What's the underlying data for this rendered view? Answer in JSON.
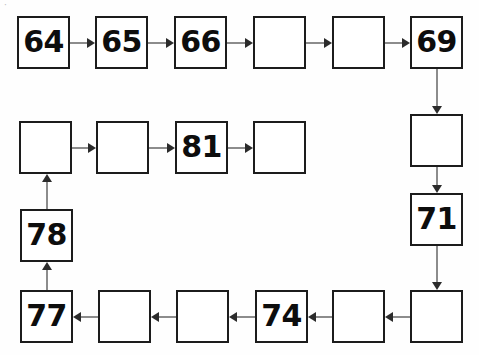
{
  "worksheet": {
    "kind": "number-sequence-chain",
    "description": "Snake-path chain of 21 square boxes; some contain numbers, the rest are blank for the student to fill in.",
    "artifact_mark": "·",
    "sequence_start": 64,
    "sequence_end": 84,
    "step": 1,
    "box_size": 53,
    "colors": {
      "page_background": "#fefefe",
      "box_border": "#1c1c1c",
      "box_fill": "#ffffff",
      "number_text": "#0d0d0d",
      "connector_line": "#8c8c8c",
      "arrow_head": "#2b2b2b"
    },
    "rows": [
      {
        "name": "top-row",
        "direction": "left-to-right",
        "cells": [
          {
            "id": "cell-64",
            "value": "64",
            "filled": true,
            "x": 17,
            "y": 16
          },
          {
            "id": "cell-65",
            "value": "65",
            "filled": true,
            "x": 95,
            "y": 16
          },
          {
            "id": "cell-66",
            "value": "66",
            "filled": true,
            "x": 174,
            "y": 16
          },
          {
            "id": "cell-67",
            "value": "",
            "filled": false,
            "x": 253,
            "y": 16
          },
          {
            "id": "cell-68",
            "value": "",
            "filled": false,
            "x": 332,
            "y": 16
          },
          {
            "id": "cell-69",
            "value": "69",
            "filled": true,
            "x": 410,
            "y": 16
          }
        ]
      },
      {
        "name": "right-column",
        "direction": "top-to-bottom",
        "cells": [
          {
            "id": "cell-70",
            "value": "",
            "filled": false,
            "x": 410,
            "y": 114
          },
          {
            "id": "cell-71",
            "value": "71",
            "filled": true,
            "x": 410,
            "y": 193
          },
          {
            "id": "cell-72",
            "value": "",
            "filled": false,
            "x": 410,
            "y": 290
          }
        ]
      },
      {
        "name": "bottom-row",
        "direction": "right-to-left",
        "cells": [
          {
            "id": "cell-73",
            "value": "",
            "filled": false,
            "x": 332,
            "y": 290
          },
          {
            "id": "cell-74",
            "value": "74",
            "filled": true,
            "x": 255,
            "y": 290
          },
          {
            "id": "cell-75",
            "value": "",
            "filled": false,
            "x": 176,
            "y": 290
          },
          {
            "id": "cell-76",
            "value": "",
            "filled": false,
            "x": 98,
            "y": 290
          },
          {
            "id": "cell-77",
            "value": "77",
            "filled": true,
            "x": 20,
            "y": 290
          }
        ]
      },
      {
        "name": "left-column",
        "direction": "bottom-to-top",
        "cells": [
          {
            "id": "cell-78",
            "value": "78",
            "filled": true,
            "x": 20,
            "y": 209
          },
          {
            "id": "cell-79",
            "value": "",
            "filled": false,
            "x": 19,
            "y": 121
          }
        ]
      },
      {
        "name": "middle-row",
        "direction": "left-to-right",
        "cells": [
          {
            "id": "cell-80",
            "value": "",
            "filled": false,
            "x": 96,
            "y": 121
          },
          {
            "id": "cell-81",
            "value": "81",
            "filled": true,
            "x": 175,
            "y": 121
          },
          {
            "id": "cell-82",
            "value": "",
            "filled": false,
            "x": 253,
            "y": 121
          }
        ]
      }
    ],
    "connectors": [
      {
        "id": "arrow-64-65",
        "from": "cell-64",
        "to": "cell-65",
        "orientation": "horizontal",
        "points": "right"
      },
      {
        "id": "arrow-65-66",
        "from": "cell-65",
        "to": "cell-66",
        "orientation": "horizontal",
        "points": "right"
      },
      {
        "id": "arrow-66-67",
        "from": "cell-66",
        "to": "cell-67",
        "orientation": "horizontal",
        "points": "right"
      },
      {
        "id": "arrow-67-68",
        "from": "cell-67",
        "to": "cell-68",
        "orientation": "horizontal",
        "points": "right"
      },
      {
        "id": "arrow-68-69",
        "from": "cell-68",
        "to": "cell-69",
        "orientation": "horizontal",
        "points": "right"
      },
      {
        "id": "arrow-69-70",
        "from": "cell-69",
        "to": "cell-70",
        "orientation": "vertical",
        "points": "down"
      },
      {
        "id": "arrow-70-71",
        "from": "cell-70",
        "to": "cell-71",
        "orientation": "vertical",
        "points": "down"
      },
      {
        "id": "arrow-71-72",
        "from": "cell-71",
        "to": "cell-72",
        "orientation": "vertical",
        "points": "down"
      },
      {
        "id": "arrow-72-73",
        "from": "cell-72",
        "to": "cell-73",
        "orientation": "horizontal",
        "points": "left"
      },
      {
        "id": "arrow-73-74",
        "from": "cell-73",
        "to": "cell-74",
        "orientation": "horizontal",
        "points": "left"
      },
      {
        "id": "arrow-74-75",
        "from": "cell-74",
        "to": "cell-75",
        "orientation": "horizontal",
        "points": "left"
      },
      {
        "id": "arrow-75-76",
        "from": "cell-75",
        "to": "cell-76",
        "orientation": "horizontal",
        "points": "left"
      },
      {
        "id": "arrow-76-77",
        "from": "cell-76",
        "to": "cell-77",
        "orientation": "horizontal",
        "points": "left"
      },
      {
        "id": "arrow-77-78",
        "from": "cell-77",
        "to": "cell-78",
        "orientation": "vertical",
        "points": "up"
      },
      {
        "id": "arrow-78-79",
        "from": "cell-78",
        "to": "cell-79",
        "orientation": "vertical",
        "points": "up"
      },
      {
        "id": "arrow-79-80",
        "from": "cell-79",
        "to": "cell-80",
        "orientation": "horizontal",
        "points": "right"
      },
      {
        "id": "arrow-80-81",
        "from": "cell-80",
        "to": "cell-81",
        "orientation": "horizontal",
        "points": "right"
      },
      {
        "id": "arrow-81-82",
        "from": "cell-81",
        "to": "cell-82",
        "orientation": "horizontal",
        "points": "right"
      }
    ]
  }
}
